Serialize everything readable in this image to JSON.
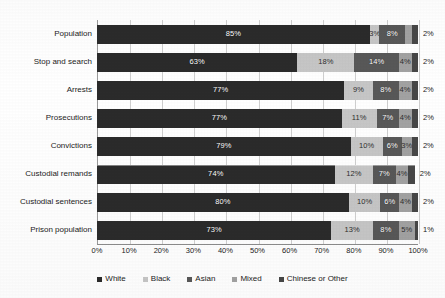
{
  "chart_data": {
    "type": "bar",
    "orientation": "horizontal",
    "stacked": true,
    "normalized_percent": true,
    "title": "",
    "subtitle": "",
    "xlabel": "",
    "ylabel": "",
    "xlim": [
      0,
      100
    ],
    "x_tick_labels": [
      "0%",
      "10%",
      "20%",
      "30%",
      "40%",
      "50%",
      "60%",
      "70%",
      "80%",
      "90%",
      "100%"
    ],
    "x_tick_values": [
      0,
      10,
      20,
      30,
      40,
      50,
      60,
      70,
      80,
      90,
      100
    ],
    "grid": true,
    "grid_axis": "x",
    "legend_position": "bottom",
    "value_label_suffix": "%",
    "categories": [
      "Population",
      "Stop and search",
      "Arrests",
      "Prosecutions",
      "Convictions",
      "Custodial remands",
      "Custodial sentences",
      "Prison population"
    ],
    "series": [
      {
        "name": "White",
        "color": "#2b2b2b",
        "values": [
          85,
          63,
          77,
          77,
          79,
          74,
          80,
          73
        ]
      },
      {
        "name": "Black",
        "color": "#c6c6c6",
        "values": [
          3,
          18,
          9,
          11,
          10,
          12,
          10,
          13
        ]
      },
      {
        "name": "Asian",
        "color": "#585858",
        "values": [
          8,
          14,
          8,
          7,
          6,
          7,
          6,
          8
        ]
      },
      {
        "name": "Mixed",
        "color": "#a2a2a2",
        "values": [
          2,
          4,
          4,
          4,
          3,
          4,
          4,
          5
        ]
      },
      {
        "name": "Chinese or Other",
        "color": "#474747",
        "values": [
          2,
          2,
          2,
          2,
          2,
          2,
          2,
          1
        ]
      }
    ],
    "data_labels": [
      {
        "category": "Population",
        "labels": [
          "85%",
          "3%",
          "8%",
          "2%",
          "2%"
        ]
      },
      {
        "category": "Stop and search",
        "labels": [
          "63%",
          "18%",
          "14%",
          "4%",
          "2%"
        ]
      },
      {
        "category": "Arrests",
        "labels": [
          "77%",
          "9%",
          "8%",
          "4%",
          "2%"
        ]
      },
      {
        "category": "Prosecutions",
        "labels": [
          "77%",
          "11%",
          "7%",
          "4%",
          "2%"
        ]
      },
      {
        "category": "Convictions",
        "labels": [
          "79%",
          "10%",
          "6%",
          "3%",
          "2%"
        ]
      },
      {
        "category": "Custodial remands",
        "labels": [
          "74%",
          "12%",
          "7%",
          "4%",
          "2%"
        ]
      },
      {
        "category": "Custodial sentences",
        "labels": [
          "80%",
          "10%",
          "6%",
          "4%",
          "2%"
        ]
      },
      {
        "category": "Prison population",
        "labels": [
          "73%",
          "13%",
          "8%",
          "5%",
          "1%"
        ]
      }
    ]
  },
  "legend": {
    "items": [
      {
        "label": "White",
        "color": "#2b2b2b"
      },
      {
        "label": "Black",
        "color": "#c6c6c6"
      },
      {
        "label": "Asian",
        "color": "#585858"
      },
      {
        "label": "Mixed",
        "color": "#a2a2a2"
      },
      {
        "label": "Chinese or Other",
        "color": "#474747"
      }
    ]
  }
}
